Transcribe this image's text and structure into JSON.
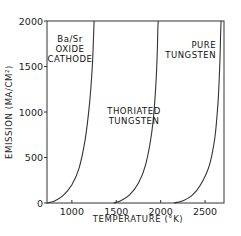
{
  "chart_data": {
    "type": "line",
    "title": "",
    "xlabel": "TEMPERATURE (°K)",
    "ylabel": "EMISSION (MA/CM²)",
    "xlim": [
      720,
      2750
    ],
    "ylim": [
      0,
      2000
    ],
    "xticks": [
      1000,
      1500,
      2000,
      2500
    ],
    "xtick_labels": [
      "1000",
      "1500",
      "2000",
      "2500"
    ],
    "yticks": [
      0,
      500,
      1000,
      1500,
      2000
    ],
    "ytick_labels": [
      "0",
      "500",
      "1000",
      "1500",
      "2000"
    ],
    "grid": false,
    "legend": "none (curves labeled by inline annotations)",
    "series": [
      {
        "name": "Ba/Sr OXIDE CATHODE",
        "label_lines": [
          "Ba/Sr",
          "OXIDE",
          "CATHODE"
        ],
        "x": [
          720,
          800,
          900,
          1000,
          1080,
          1150,
          1200,
          1230,
          1245,
          1250
        ],
        "y": [
          0,
          20,
          80,
          200,
          380,
          700,
          1100,
          1500,
          1850,
          2000
        ]
      },
      {
        "name": "THORIATED TUNGSTEN",
        "label_lines": [
          "THORIATED",
          "TUNGSTEN"
        ],
        "x": [
          1470,
          1550,
          1650,
          1750,
          1830,
          1900,
          1940,
          1960,
          1968,
          1972
        ],
        "y": [
          0,
          25,
          90,
          220,
          420,
          780,
          1200,
          1600,
          1900,
          2000
        ]
      },
      {
        "name": "PURE TUNGSTEN",
        "label_lines": [
          "PURE",
          "TUNGSTEN"
        ],
        "x": [
          2150,
          2250,
          2350,
          2450,
          2550,
          2610,
          2645,
          2665,
          2675,
          2680
        ],
        "y": [
          0,
          25,
          80,
          200,
          420,
          720,
          1100,
          1500,
          1850,
          2000
        ]
      }
    ]
  }
}
